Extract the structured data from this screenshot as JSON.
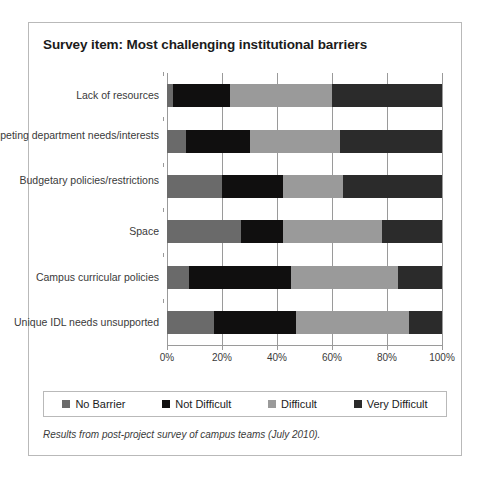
{
  "figure": {
    "title": "Survey item: Most challenging institutional barriers",
    "footnote": "Results from post-project survey of campus teams (July 2010)."
  },
  "legend": {
    "items": [
      {
        "label": "No Barrier",
        "color": "#6a6a6a"
      },
      {
        "label": "Not Difficult",
        "color": "#100f0f"
      },
      {
        "label": "Difficult",
        "color": "#9a9a9a"
      },
      {
        "label": "Very Difficult",
        "color": "#2b2b2b"
      }
    ]
  },
  "axis": {
    "x_ticks": [
      "0%",
      "20%",
      "40%",
      "60%",
      "80%",
      "100%"
    ],
    "x_values": [
      0,
      20,
      40,
      60,
      80,
      100
    ]
  },
  "chart_data": {
    "type": "bar",
    "orientation": "horizontal",
    "stacked": true,
    "stack_total": 100,
    "title": "Survey item: Most challenging institutional barriers",
    "xlabel": "",
    "ylabel": "",
    "xlim": [
      0,
      100
    ],
    "x_tick_labels": [
      "0%",
      "20%",
      "40%",
      "60%",
      "80%",
      "100%"
    ],
    "grid": true,
    "legend_position": "bottom",
    "categories": [
      "Lack of resources",
      "Competing department needs/interests",
      "Budgetary policies/restrictions",
      "Space",
      "Campus curricular policies",
      "Unique IDL needs unsupported"
    ],
    "series": [
      {
        "name": "No Barrier",
        "color": "#6a6a6a",
        "values": [
          2,
          7,
          20,
          27,
          8,
          17
        ]
      },
      {
        "name": "Not Difficult",
        "color": "#100f0f",
        "values": [
          21,
          23,
          22,
          15,
          37,
          30
        ]
      },
      {
        "name": "Difficult",
        "color": "#9a9a9a",
        "values": [
          37,
          33,
          22,
          36,
          39,
          41
        ]
      },
      {
        "name": "Very Difficult",
        "color": "#2b2b2b",
        "values": [
          40,
          37,
          36,
          22,
          16,
          12
        ]
      }
    ]
  }
}
